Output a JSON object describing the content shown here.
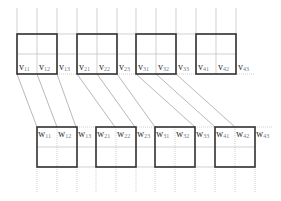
{
  "top_row": {
    "label_prefix": "v",
    "squares": [
      {
        "x": 17,
        "labels": [
          "v11",
          "v12",
          "v13"
        ]
      },
      {
        "x": 77,
        "labels": [
          "v21",
          "v22",
          "v23"
        ]
      },
      {
        "x": 136,
        "labels": [
          "v31",
          "v32",
          "v33"
        ]
      },
      {
        "x": 196,
        "labels": [
          "v41",
          "v42",
          "v43"
        ]
      }
    ],
    "y": 34,
    "size": 40
  },
  "bottom_row": {
    "label_prefix": "w",
    "squares": [
      {
        "x": 37,
        "labels": [
          "w11",
          "w12",
          "w13"
        ]
      },
      {
        "x": 96,
        "labels": [
          "w21",
          "w22",
          "w23"
        ]
      },
      {
        "x": 155,
        "labels": [
          "w31",
          "w32",
          "w33"
        ]
      },
      {
        "x": 215,
        "labels": [
          "w41",
          "w42",
          "w43"
        ]
      }
    ],
    "y": 127,
    "size": 40
  },
  "connections": [
    {
      "from": 17,
      "to": 37
    },
    {
      "from": 37,
      "to": 57
    },
    {
      "from": 57,
      "to": 76
    },
    {
      "from": 77,
      "to": 115
    },
    {
      "from": 97,
      "to": 135
    },
    {
      "from": 117,
      "to": 155
    },
    {
      "from": 136,
      "to": 195
    },
    {
      "from": 156,
      "to": 215
    },
    {
      "from": 176,
      "to": 235
    }
  ],
  "colors": {
    "square_border": "#333333",
    "grid_line": "#bbbbbb",
    "connector": "#999999",
    "label": "#333333"
  }
}
